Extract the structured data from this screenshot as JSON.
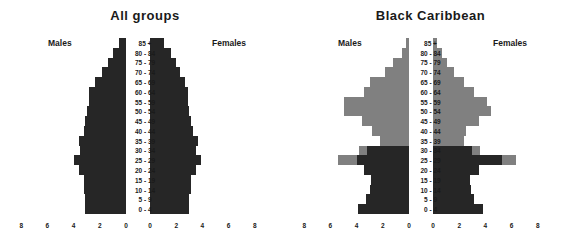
{
  "figure": {
    "background_color": "#ffffff",
    "text_color": "#1a1a1a"
  },
  "colors": {
    "dark": "#262626",
    "gray": "#808080"
  },
  "axis": {
    "ticks": [
      "8",
      "6",
      "4",
      "2",
      "0",
      "0",
      "2",
      "4",
      "6",
      "8"
    ],
    "max": 8
  },
  "labels": {
    "males": "Males",
    "females": "Females"
  },
  "age_groups": [
    "85 +",
    "80 - 84",
    "75 - 79",
    "70 - 74",
    "65 - 69",
    "60 - 64",
    "55 - 59",
    "50 - 54",
    "45 - 49",
    "40 - 44",
    "35 - 39",
    "30 - 34",
    "25 - 29",
    "20 - 24",
    "15 - 19",
    "10 - 14",
    "5 - 9",
    "0 - 4"
  ],
  "chart_data": [
    {
      "type": "bar",
      "title": "All groups",
      "subtype": "population-pyramid",
      "xlabel": "",
      "ylabel": "",
      "xlim": [
        -8,
        8
      ],
      "grid": false,
      "legend": null,
      "categories": [
        "85 +",
        "80 - 84",
        "75 - 79",
        "70 - 74",
        "65 - 69",
        "60 - 64",
        "55 - 59",
        "50 - 54",
        "45 - 49",
        "40 - 44",
        "35 - 39",
        "30 - 34",
        "25 - 29",
        "20 - 24",
        "15 - 19",
        "10 - 14",
        "5 - 9",
        "0 - 4"
      ],
      "series": [
        {
          "name": "Males",
          "side": "left",
          "color": "#262626",
          "values": [
            0.5,
            1.0,
            1.4,
            1.8,
            2.4,
            2.8,
            2.8,
            3.0,
            3.1,
            3.2,
            3.6,
            3.5,
            4.0,
            3.6,
            3.2,
            3.2,
            3.1,
            3.1
          ]
        },
        {
          "name": "Females",
          "side": "right",
          "color": "#262626",
          "values": [
            1.1,
            1.6,
            2.0,
            2.3,
            2.7,
            2.9,
            2.9,
            3.0,
            3.1,
            3.3,
            3.7,
            3.5,
            3.9,
            3.5,
            3.1,
            3.1,
            3.0,
            3.0
          ]
        }
      ]
    },
    {
      "type": "bar",
      "title": "Black Caribbean",
      "subtype": "population-pyramid",
      "xlabel": "",
      "ylabel": "",
      "xlim": [
        -8,
        8
      ],
      "grid": false,
      "legend": null,
      "categories": [
        "85 +",
        "80 - 84",
        "75 - 79",
        "70 - 74",
        "65 - 69",
        "60 - 64",
        "55 - 59",
        "50 - 54",
        "45 - 49",
        "40 - 44",
        "35 - 39",
        "30 - 34",
        "25 - 29",
        "20 - 24",
        "15 - 19",
        "10 - 14",
        "5 - 9",
        "0 - 4"
      ],
      "series": [
        {
          "name": "Males (dark)",
          "side": "left",
          "color": "#262626",
          "values": [
            0.0,
            0.0,
            0.0,
            0.0,
            0.0,
            0.0,
            0.0,
            0.0,
            0.0,
            0.0,
            0.0,
            3.2,
            4.0,
            3.4,
            2.9,
            3.0,
            3.3,
            3.9
          ]
        },
        {
          "name": "Males (gray)",
          "side": "left",
          "color": "#808080",
          "values": [
            0.2,
            0.5,
            1.2,
            1.8,
            3.0,
            3.4,
            5.0,
            5.0,
            3.6,
            2.8,
            2.2,
            3.8,
            5.4,
            3.4,
            0.0,
            0.0,
            0.0,
            0.0
          ]
        },
        {
          "name": "Females (dark)",
          "side": "right",
          "color": "#262626",
          "values": [
            0.0,
            0.0,
            0.0,
            0.0,
            0.0,
            0.0,
            0.0,
            0.0,
            0.0,
            0.0,
            0.0,
            3.0,
            5.3,
            3.5,
            2.8,
            2.9,
            3.1,
            3.8
          ]
        },
        {
          "name": "Females (gray)",
          "side": "right",
          "color": "#808080",
          "values": [
            0.3,
            0.7,
            1.1,
            1.6,
            2.4,
            3.1,
            4.1,
            4.4,
            3.5,
            2.5,
            2.4,
            3.6,
            6.3,
            3.5,
            0.0,
            0.0,
            0.0,
            0.0
          ]
        }
      ]
    }
  ]
}
